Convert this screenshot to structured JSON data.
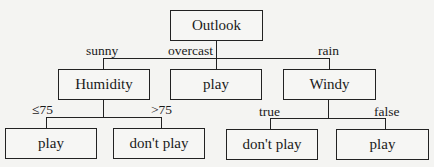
{
  "tree": {
    "root": {
      "label": "Outlook"
    },
    "branches": {
      "sunny": "sunny",
      "overcast": "overcast",
      "rain": "rain",
      "le75": "≤75",
      "gt75": ">75",
      "true": "true",
      "false": "false"
    },
    "level1": {
      "humidity": "Humidity",
      "overcast_leaf": "play",
      "windy": "Windy"
    },
    "level2": {
      "humidity_le75": "play",
      "humidity_gt75": "don't play",
      "windy_true": "don't play",
      "windy_false": "play"
    }
  }
}
